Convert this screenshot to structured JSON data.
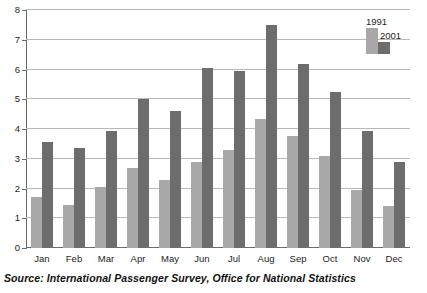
{
  "source_note": "Source: International Passenger Survey, Office for National Statistics",
  "legend": {
    "position": "top-right",
    "entries": [
      {
        "label": "1991",
        "color": "#a8a8a8"
      },
      {
        "label": "2001",
        "color": "#6d6d6d"
      }
    ]
  },
  "axis": {
    "y_ticks": [
      "0",
      "1",
      "2",
      "3",
      "4",
      "5",
      "6",
      "7",
      "8"
    ],
    "x_ticks": [
      "Jan",
      "Feb",
      "Mar",
      "Apr",
      "May",
      "Jun",
      "Jul",
      "Aug",
      "Sep",
      "Oct",
      "Nov",
      "Dec"
    ]
  },
  "chart_data": {
    "type": "bar",
    "title": "",
    "subtitle": "",
    "xlabel": "",
    "ylabel": "",
    "ylim": [
      0,
      8
    ],
    "ytick_step": 1,
    "grid": true,
    "legend_position": "top-right",
    "categories": [
      "Jan",
      "Feb",
      "Mar",
      "Apr",
      "May",
      "Jun",
      "Jul",
      "Aug",
      "Sep",
      "Oct",
      "Nov",
      "Dec"
    ],
    "series": [
      {
        "name": "1991",
        "color": "#a8a8a8",
        "values": [
          1.7,
          1.45,
          2.05,
          2.7,
          2.3,
          2.9,
          3.3,
          4.35,
          3.75,
          3.1,
          1.95,
          1.4
        ]
      },
      {
        "name": "2001",
        "color": "#6d6d6d",
        "values": [
          3.55,
          3.35,
          3.95,
          5.0,
          4.6,
          6.05,
          5.95,
          7.5,
          6.2,
          5.25,
          3.95,
          2.9
        ]
      }
    ],
    "annotations": []
  }
}
